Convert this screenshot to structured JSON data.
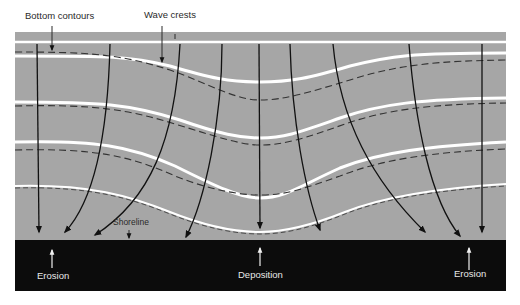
{
  "diagram": {
    "labels": {
      "bottom_contours": "Bottom contours",
      "wave_crests": "Wave crests",
      "shoreline": "Shoreline",
      "erosion_left": "Erosion",
      "deposition": "Deposition",
      "erosion_right": "Erosion"
    },
    "colors": {
      "water": "#a6a6a6",
      "land": "#0c0c0c",
      "crest": "#ffffff",
      "contour": "#333333",
      "ray": "#111111",
      "label_dark": "#2a2a2a",
      "label_light": "#e8e8e8"
    },
    "elements": {
      "wave_crest_count": 4,
      "bottom_contour_count": 4,
      "orthogonal_ray_count": 11
    }
  }
}
